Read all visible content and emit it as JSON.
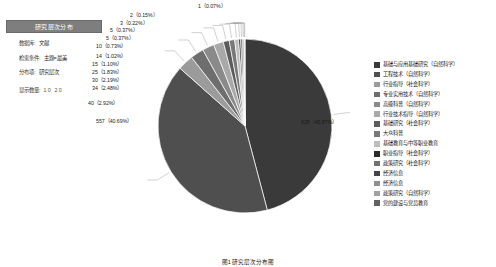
{
  "panel": {
    "title": "研究层次分布",
    "rows": [
      {
        "key": "数据库:",
        "value": "文献"
      },
      {
        "key": "检索条件:",
        "value": "主题=最美"
      },
      {
        "key": "分布项:",
        "value": "研究层次"
      },
      {
        "key": "显示数量:",
        "value": "10  20"
      }
    ]
  },
  "caption": "图1  研究层次分布图",
  "legend": {
    "items": [
      {
        "label": "基础与应用基础研究（自然科学）",
        "color": "#3a3a3a"
      },
      {
        "label": "工程技术（自然科学）",
        "color": "#4f4f4f"
      },
      {
        "label": "行业指导（社会科学）",
        "color": "#9b9b9b"
      },
      {
        "label": "专业实用技术（自然科学）",
        "color": "#6e6e6e"
      },
      {
        "label": "高级科普（自然科学）",
        "color": "#8a8a8a"
      },
      {
        "label": "行业技术指导（自然科学）",
        "color": "#a9a9a9"
      },
      {
        "label": "基础研究（社会科学）",
        "color": "#5c5c5c"
      },
      {
        "label": "大众科普",
        "color": "#787878"
      },
      {
        "label": "基础教育与中等职业教育",
        "color": "#bdbdbd"
      },
      {
        "label": "职业指导（社会科学）",
        "color": "#2b2b2b"
      },
      {
        "label": "政策研究（社会科学）",
        "color": "#707070"
      },
      {
        "label": "经济信息",
        "color": "#454545"
      },
      {
        "label": "经济信息",
        "color": "#8f8f8f"
      },
      {
        "label": "政策研究（自然科学）",
        "color": "#a0a0a0"
      },
      {
        "label": "党的建设与党员教育",
        "color": "#606060"
      }
    ]
  },
  "chart_data": {
    "type": "pie",
    "title": "研究层次分布",
    "legend_position": "right",
    "total": 1370,
    "categories": [
      "基础与应用基础研究（自然科学）",
      "工程技术（自然科学）",
      "行业指导（社会科学）",
      "专业实用技术（自然科学）",
      "高级科普（自然科学）",
      "行业技术指导（自然科学）",
      "基础研究（社会科学）",
      "大众科普",
      "基础教育与中等职业教育",
      "职业指导（社会科学）",
      "政策研究（社会科学）",
      "经济信息",
      "政策研究（自然科学）",
      "党的建设与党员教育"
    ],
    "values": [
      628,
      557,
      40,
      34,
      30,
      25,
      15,
      14,
      10,
      5,
      5,
      3,
      2,
      1
    ],
    "percents": [
      45.87,
      40.69,
      2.92,
      2.48,
      2.19,
      1.83,
      1.1,
      1.02,
      0.73,
      0.37,
      0.37,
      0.22,
      0.15,
      0.07
    ],
    "labels": [
      "628（45.87%）",
      "557（40.69%）",
      "40（2.92%）",
      "34（2.48%）",
      "30（2.19%）",
      "25（1.83%）",
      "15（1.10%）",
      "14（1.02%）",
      "10（0.73%）",
      "5（0.37%）",
      "5（0.37%）",
      "3（0.22%）",
      "2（0.15%）",
      "1（0.07%）"
    ]
  }
}
